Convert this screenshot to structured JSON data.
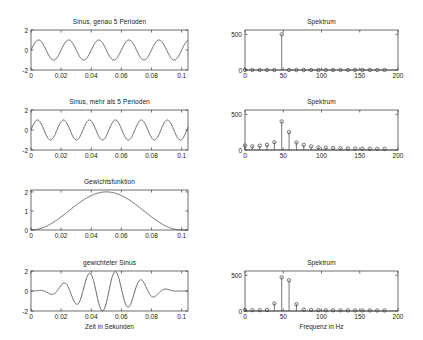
{
  "figure": {
    "background": "#ffffff",
    "line_color": "#3c3c3c",
    "axis_color": "#4a4a4a",
    "text_color": "#1a1a1a"
  },
  "chart_data": [
    {
      "id": "sinus-exact",
      "type": "line",
      "title": "Sinus, genau 5 Perioden",
      "xlabel": "",
      "ylabel": "",
      "xlim": [
        0,
        0.1042
      ],
      "ylim": [
        -2,
        2
      ],
      "xticks": [
        0,
        0.02,
        0.04,
        0.06,
        0.08,
        0.1
      ],
      "xticklabels": [
        "0",
        "0.02",
        "0.04",
        "0.06",
        "0.08",
        "0.1"
      ],
      "yticks": [
        -2,
        0,
        2
      ],
      "yticklabels": [
        "-2",
        "0",
        "2"
      ],
      "grid": false,
      "waveform": {
        "kind": "sine",
        "amplitude": 1,
        "periods": 5,
        "phase": 0
      }
    },
    {
      "id": "spektrum-exact",
      "type": "stem",
      "title": "Spektrum",
      "xlabel": "",
      "ylabel": "",
      "xlim": [
        0,
        200
      ],
      "ylim": [
        0,
        560
      ],
      "xticks": [
        0,
        50,
        100,
        150,
        200
      ],
      "xticklabels": [
        "0",
        "50",
        "100",
        "150",
        "200"
      ],
      "yticks": [
        0,
        500
      ],
      "yticklabels": [
        "0",
        "500"
      ],
      "grid": false,
      "x": [
        0,
        9.6,
        19.2,
        28.8,
        38.4,
        48,
        57.6,
        67.2,
        76.8,
        86.4,
        96,
        105.6,
        115.2,
        124.8,
        134.4,
        144,
        153.6,
        163.2,
        172.8,
        182.4
      ],
      "values": [
        0,
        0,
        0,
        0,
        0,
        500,
        0,
        0,
        0,
        0,
        0,
        0,
        0,
        0,
        0,
        0,
        0,
        0,
        0,
        0
      ]
    },
    {
      "id": "sinus-more",
      "type": "line",
      "title": "Sinus, mehr als 5 Perioden",
      "xlabel": "",
      "ylabel": "",
      "xlim": [
        0,
        0.1042
      ],
      "ylim": [
        -2,
        2
      ],
      "xticks": [
        0,
        0.02,
        0.04,
        0.06,
        0.08,
        0.1
      ],
      "xticklabels": [
        "0",
        "0.02",
        "0.04",
        "0.06",
        "0.08",
        "0.1"
      ],
      "yticks": [
        -2,
        0,
        2
      ],
      "yticklabels": [
        "-2",
        "0",
        "2"
      ],
      "grid": false,
      "waveform": {
        "kind": "sine",
        "amplitude": 1,
        "periods": 5.8,
        "phase": 0
      }
    },
    {
      "id": "spektrum-more",
      "type": "stem",
      "title": "Spektrum",
      "xlabel": "",
      "ylabel": "",
      "xlim": [
        0,
        200
      ],
      "ylim": [
        0,
        560
      ],
      "xticks": [
        0,
        50,
        100,
        150,
        200
      ],
      "xticklabels": [
        "0",
        "50",
        "100",
        "150",
        "200"
      ],
      "yticks": [
        0,
        500
      ],
      "yticklabels": [
        "0",
        "500"
      ],
      "grid": false,
      "x": [
        0,
        9.6,
        19.2,
        28.8,
        38.4,
        48,
        57.6,
        67.2,
        76.8,
        86.4,
        96,
        105.6,
        115.2,
        124.8,
        134.4,
        144,
        153.6,
        163.2,
        172.8,
        182.4
      ],
      "values": [
        62,
        52,
        60,
        72,
        110,
        400,
        250,
        105,
        72,
        50,
        38,
        32,
        28,
        25,
        22,
        20,
        18,
        17,
        16,
        15
      ]
    },
    {
      "id": "gewichtsfunktion",
      "type": "line",
      "title": "Gewichtsfunktion",
      "xlabel": "",
      "ylabel": "",
      "xlim": [
        0,
        0.1042
      ],
      "ylim": [
        0,
        2.1
      ],
      "xticks": [
        0,
        0.02,
        0.04,
        0.06,
        0.08,
        0.1
      ],
      "xticklabels": [
        "0",
        "0.02",
        "0.04",
        "0.06",
        "0.08",
        "0.1"
      ],
      "yticks": [
        0,
        1,
        2
      ],
      "yticklabels": [
        "0",
        "1",
        "2"
      ],
      "grid": false,
      "waveform": {
        "kind": "hann",
        "amplitude": 2
      }
    },
    {
      "id": "gewichteter-sinus",
      "type": "line",
      "title": "gewichteter Sinus",
      "xlabel": "Zeit in Sekunden",
      "ylabel": "",
      "xlim": [
        0,
        0.1042
      ],
      "ylim": [
        -2,
        2
      ],
      "xticks": [
        0,
        0.02,
        0.04,
        0.06,
        0.08,
        0.1
      ],
      "xticklabels": [
        "0",
        "0.02",
        "0.04",
        "0.06",
        "0.08",
        "0.1"
      ],
      "yticks": [
        -2,
        0,
        2
      ],
      "yticklabels": [
        "-2",
        "0",
        "2"
      ],
      "grid": false,
      "waveform": {
        "kind": "windowed-sine",
        "amplitude": 2,
        "periods": 5.8,
        "phase": 0
      }
    },
    {
      "id": "spektrum-gewichtet",
      "type": "stem",
      "title": "Spektrum",
      "xlabel": "Frequenz in Hz",
      "ylabel": "",
      "xlim": [
        0,
        200
      ],
      "ylim": [
        0,
        560
      ],
      "xticks": [
        0,
        50,
        100,
        150,
        200
      ],
      "xticklabels": [
        "0",
        "50",
        "100",
        "150",
        "200"
      ],
      "yticks": [
        0,
        500
      ],
      "yticklabels": [
        "0",
        "500"
      ],
      "grid": false,
      "x": [
        0,
        9.6,
        19.2,
        28.8,
        38.4,
        48,
        57.6,
        67.2,
        76.8,
        86.4,
        96,
        105.6,
        115.2,
        124.8,
        134.4,
        144,
        153.6,
        163.2,
        172.8,
        182.4
      ],
      "values": [
        14,
        12,
        12,
        14,
        105,
        470,
        430,
        95,
        20,
        14,
        12,
        10,
        10,
        9,
        9,
        8,
        8,
        8,
        7,
        7
      ]
    }
  ]
}
